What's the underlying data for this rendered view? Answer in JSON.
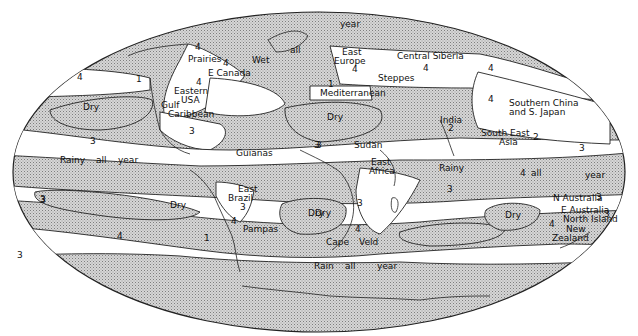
{
  "map": {
    "projection": "elliptical world map",
    "colors": {
      "stipple": "#c9c9c9",
      "stipple_dot": "#8a8a8a",
      "outline": "#222222",
      "background": "#ffffff"
    },
    "legend_note": "Stippled = shaded zones; white bands numbered by region type",
    "labels": [
      {
        "id": "prairies",
        "text": "Prairies",
        "x": 188,
        "y": 62
      },
      {
        "id": "prairies-num",
        "text": "4",
        "x": 195,
        "y": 50
      },
      {
        "id": "wet",
        "text": "Wet",
        "x": 252,
        "y": 63
      },
      {
        "id": "all-north",
        "text": "all",
        "x": 290,
        "y": 53
      },
      {
        "id": "year-north",
        "text": "year",
        "x": 340,
        "y": 27
      },
      {
        "id": "e-canada",
        "text": "E Canada",
        "x": 208,
        "y": 76
      },
      {
        "id": "e-canada-num",
        "text": "4",
        "x": 223,
        "y": 66
      },
      {
        "id": "eastern-usa-num",
        "text": "4",
        "x": 196,
        "y": 85
      },
      {
        "id": "eastern-usa",
        "text": "Eastern",
        "x": 174,
        "y": 94
      },
      {
        "id": "usa",
        "text": "USA",
        "x": 181,
        "y": 103
      },
      {
        "id": "gulf",
        "text": "Gulf",
        "x": 161,
        "y": 108
      },
      {
        "id": "caribbean",
        "text": "Caribbean",
        "x": 168,
        "y": 117
      },
      {
        "id": "caribbean-num",
        "text": "3",
        "x": 189,
        "y": 134
      },
      {
        "id": "pacific-n-4",
        "text": "4",
        "x": 77,
        "y": 80
      },
      {
        "id": "pacific-n-1",
        "text": "1",
        "x": 136,
        "y": 82
      },
      {
        "id": "dry-n-pacific",
        "text": "Dry",
        "x": 83,
        "y": 110
      },
      {
        "id": "pacific-3",
        "text": "3",
        "x": 90,
        "y": 144
      },
      {
        "id": "rainy-w",
        "text": "Rainy",
        "x": 60,
        "y": 163
      },
      {
        "id": "all-w",
        "text": "all",
        "x": 96,
        "y": 163
      },
      {
        "id": "year-w",
        "text": "year",
        "x": 118,
        "y": 163
      },
      {
        "id": "guianas",
        "text": "Guianas",
        "x": 236,
        "y": 156
      },
      {
        "id": "atl-3",
        "text": "3",
        "x": 316,
        "y": 148
      },
      {
        "id": "east-europe",
        "text": "East",
        "x": 342,
        "y": 55
      },
      {
        "id": "europe",
        "text": "Europe",
        "x": 334,
        "y": 64
      },
      {
        "id": "europe-num",
        "text": "4",
        "x": 352,
        "y": 72
      },
      {
        "id": "steppes",
        "text": "Steppes",
        "x": 378,
        "y": 81
      },
      {
        "id": "med-num",
        "text": "1",
        "x": 328,
        "y": 87
      },
      {
        "id": "mediterranean",
        "text": "Mediterranean",
        "x": 320,
        "y": 96
      },
      {
        "id": "dry-sahara",
        "text": "Dry",
        "x": 327,
        "y": 120
      },
      {
        "id": "central-siberia",
        "text": "Central Siberia",
        "x": 397,
        "y": 59
      },
      {
        "id": "siberia-num",
        "text": "4",
        "x": 423,
        "y": 71
      },
      {
        "id": "e-asia-4a",
        "text": "4",
        "x": 488,
        "y": 71
      },
      {
        "id": "e-asia-4b",
        "text": "4",
        "x": 488,
        "y": 102
      },
      {
        "id": "s-china",
        "text": "Southern China",
        "x": 509,
        "y": 106
      },
      {
        "id": "s-japan",
        "text": "and S. Japan",
        "x": 509,
        "y": 115
      },
      {
        "id": "india",
        "text": "India",
        "x": 440,
        "y": 123
      },
      {
        "id": "india-num",
        "text": "2",
        "x": 448,
        "y": 131
      },
      {
        "id": "se-asia",
        "text": "South East",
        "x": 481,
        "y": 136
      },
      {
        "id": "asia",
        "text": "Asia",
        "x": 499,
        "y": 145
      },
      {
        "id": "pac-2",
        "text": "2",
        "x": 533,
        "y": 140
      },
      {
        "id": "pac-3",
        "text": "3",
        "x": 579,
        "y": 151
      },
      {
        "id": "sudan",
        "text": "Sudan",
        "x": 354,
        "y": 148
      },
      {
        "id": "sudan-num",
        "text": "3",
        "x": 314,
        "y": 148
      },
      {
        "id": "east-africa",
        "text": "East",
        "x": 371,
        "y": 165
      },
      {
        "id": "africa",
        "text": "Africa",
        "x": 369,
        "y": 174
      },
      {
        "id": "rainy-io",
        "text": "Rainy",
        "x": 439,
        "y": 171
      },
      {
        "id": "io-3",
        "text": "3",
        "x": 447,
        "y": 192
      },
      {
        "id": "all-e",
        "text": "all",
        "x": 531,
        "y": 176
      },
      {
        "id": "num-4-e",
        "text": "4",
        "x": 520,
        "y": 176
      },
      {
        "id": "year-e",
        "text": "year",
        "x": 585,
        "y": 178
      },
      {
        "id": "n-australia",
        "text": "N Australia",
        "x": 553,
        "y": 201
      },
      {
        "id": "n-australia-num",
        "text": "3",
        "x": 596,
        "y": 200
      },
      {
        "id": "e-australia",
        "text": "E Australia",
        "x": 561,
        "y": 213
      },
      {
        "id": "north-island",
        "text": "North Island",
        "x": 563,
        "y": 222
      },
      {
        "id": "nz-num",
        "text": "4",
        "x": 549,
        "y": 227
      },
      {
        "id": "new",
        "text": "New",
        "x": 566,
        "y": 232
      },
      {
        "id": "zealand",
        "text": "Zealand",
        "x": 552,
        "y": 241
      },
      {
        "id": "dry-australia",
        "text": "Dry",
        "x": 505,
        "y": 218
      },
      {
        "id": "east-brazil",
        "text": "East",
        "x": 238,
        "y": 192
      },
      {
        "id": "brazil",
        "text": "Brazil",
        "x": 228,
        "y": 201
      },
      {
        "id": "brazil-num",
        "text": "3",
        "x": 240,
        "y": 210
      },
      {
        "id": "pampas-num",
        "text": "4",
        "x": 231,
        "y": 224
      },
      {
        "id": "pampas",
        "text": "Pampas",
        "x": 243,
        "y": 232
      },
      {
        "id": "dry-s-america",
        "text": "Dry",
        "x": 170,
        "y": 208
      },
      {
        "id": "sp-3",
        "text": "3",
        "x": 40,
        "y": 202
      },
      {
        "id": "sp-4",
        "text": "4",
        "x": 117,
        "y": 239
      },
      {
        "id": "sp-1",
        "text": "1",
        "x": 204,
        "y": 241
      },
      {
        "id": "sa-atl-3",
        "text": "3",
        "x": 40,
        "y": 203
      },
      {
        "id": "dry-s-africa",
        "text": "Dry",
        "x": 315,
        "y": 216
      },
      {
        "id": "s-africa-num",
        "text": "3",
        "x": 357,
        "y": 206
      },
      {
        "id": "cape-num",
        "text": "4",
        "x": 355,
        "y": 232
      },
      {
        "id": "cape",
        "text": "Cape",
        "x": 326,
        "y": 245
      },
      {
        "id": "veld",
        "text": "Veld",
        "x": 359,
        "y": 245
      },
      {
        "id": "dry-s-atl",
        "text": "Dry",
        "x": 308,
        "y": 216
      },
      {
        "id": "rain",
        "text": "Rain",
        "x": 314,
        "y": 269
      },
      {
        "id": "all-s",
        "text": "all",
        "x": 345,
        "y": 269
      },
      {
        "id": "year-s",
        "text": "year",
        "x": 377,
        "y": 269
      },
      {
        "id": "far-e-3",
        "text": "3",
        "x": 604,
        "y": 217
      },
      {
        "id": "atl-sw-3",
        "text": "3",
        "x": 17,
        "y": 258
      }
    ]
  }
}
